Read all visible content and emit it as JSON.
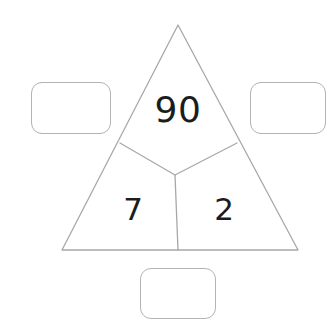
{
  "page": {
    "background_color": "#ffffff"
  },
  "figure": {
    "name": "number-triangle",
    "stroke_color": "#a8a8a8",
    "fill_color": "#ffffff",
    "stroke_width": 1.3,
    "apex": [
      178,
      25
    ],
    "base_left": [
      62,
      250
    ],
    "base_right": [
      298,
      250
    ],
    "junction": [
      175,
      175
    ],
    "left_edge_point": [
      120,
      143
    ],
    "right_edge_point": [
      237,
      143
    ],
    "base_point": [
      178,
      250
    ]
  },
  "cells": {
    "top": {
      "label": "top-cell",
      "value": "90"
    },
    "bottom_left": {
      "label": "bottom-left-cell",
      "value": "7"
    },
    "bottom_right": {
      "label": "bottom-right-cell",
      "value": "2"
    },
    "text_color": "#1c1c1c"
  },
  "answer_boxes": {
    "border_color": "#b3b3b3",
    "fill_color": "#ffffff",
    "corner_radius": 11,
    "left": {
      "name": "left-answer-box",
      "value": "",
      "placeholder": ""
    },
    "right": {
      "name": "right-answer-box",
      "value": "",
      "placeholder": ""
    },
    "bottom": {
      "name": "bottom-answer-box",
      "value": "",
      "placeholder": ""
    }
  }
}
